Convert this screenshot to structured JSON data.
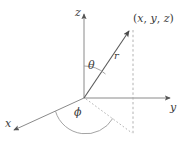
{
  "figure": {
    "background_color": "#ffffff",
    "line_color": "#7a7a7a",
    "text_color": "#3b3b3b"
  },
  "axes": {
    "z": {
      "label": "z",
      "direction": "up"
    },
    "y": {
      "label": "y",
      "direction": "right"
    },
    "x": {
      "label": "x",
      "direction": "down-left"
    }
  },
  "point": {
    "label": "(x, y, z)",
    "open_paren": "(",
    "x_symbol": "x",
    "comma_1": ", ",
    "y_symbol": "y",
    "comma_2": ", ",
    "z_symbol": "z",
    "close_paren": ")"
  },
  "vector": {
    "label": "r",
    "description": "radial-distance-from-origin"
  },
  "angles": {
    "theta": {
      "label": "θ",
      "description": "polar-angle-from-z-axis"
    },
    "phi": {
      "label": "ϕ",
      "description": "azimuthal-angle-in-xy-plane"
    }
  },
  "geometry": {
    "origin": {
      "x": 84,
      "y": 98
    },
    "z_tip": {
      "x": 84,
      "y": 13
    },
    "y_tip": {
      "x": 172,
      "y": 98
    },
    "x_tip": {
      "x": 12,
      "y": 131
    },
    "r_tip": {
      "x": 130,
      "y": 30
    },
    "projection_point": {
      "x": 133,
      "y": 133
    },
    "dashed_vertical": {
      "x": 133,
      "y_top": 30,
      "y_bottom": 135
    }
  }
}
